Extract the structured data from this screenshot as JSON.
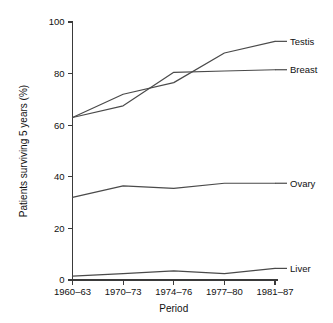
{
  "chart_data": {
    "type": "line",
    "title": "",
    "xlabel": "Period",
    "ylabel": "Patients surviving 5 years (%)",
    "categories": [
      "1960–63",
      "1970–73",
      "1974–76",
      "1977–80",
      "1981–87"
    ],
    "ylim": [
      0,
      100
    ],
    "yticks": [
      0,
      20,
      40,
      60,
      80,
      100
    ],
    "ytick_labels": [
      "0",
      "20",
      "40",
      "60",
      "80",
      "100"
    ],
    "grid": false,
    "legend_position": "right-inline-labels",
    "line_color": "#4a4a4a",
    "axis_color": "#3a3a3a",
    "background": "#ffffff",
    "series": [
      {
        "name": "Testis",
        "values": [
          63,
          72,
          76.5,
          88,
          92.5
        ]
      },
      {
        "name": "Breast",
        "values": [
          63,
          67.5,
          80.5,
          81,
          81.5
        ]
      },
      {
        "name": "Ovary",
        "values": [
          32,
          36.5,
          35.5,
          37.5,
          37.5
        ]
      },
      {
        "name": "Liver",
        "values": [
          1.5,
          2.5,
          3.5,
          2.5,
          4.5
        ]
      }
    ]
  }
}
